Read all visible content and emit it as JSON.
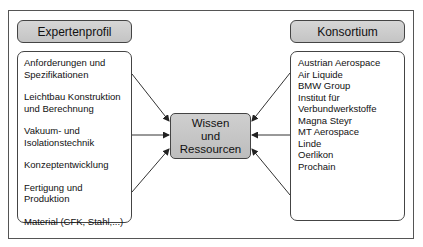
{
  "left": {
    "title": "Expertenprofil",
    "items": [
      "Anforderungen und\nSpezifikationen",
      "Leichtbau Konstruktion\nund Berechnung",
      "Vakuum- und\nIsolationstechnik",
      "Konzeptentwicklung",
      "Fertigung und Produktion",
      "Material (CFK, Stahl,...)"
    ]
  },
  "center": {
    "lines": [
      "Wissen",
      "und",
      "Ressourcen"
    ]
  },
  "right": {
    "title": "Konsortium",
    "items": [
      "Austrian Aerospace",
      "Air Liquide",
      "BMW Group",
      "Institut für",
      "Verbundwerkstoffe",
      "Magna Steyr",
      "MT Aerospace",
      "Linde",
      "Oerlikon",
      "Prochain"
    ]
  },
  "colors": {
    "header_fill": "#c8c8c8",
    "border": "#444444",
    "arrow": "#333333"
  }
}
